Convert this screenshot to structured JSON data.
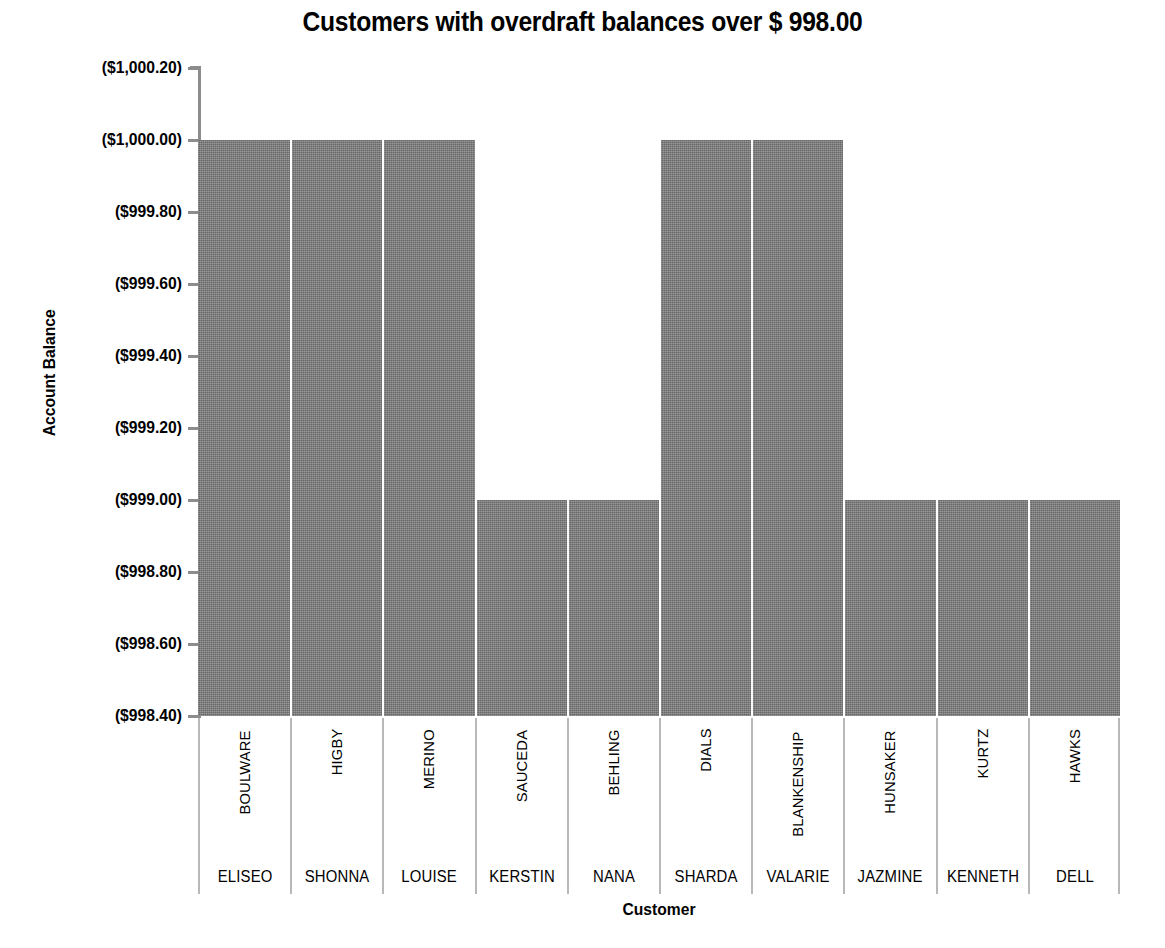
{
  "chart_data": {
    "type": "bar",
    "title": "Customers with overdraft balances over $ 998.00",
    "xlabel": "Customer",
    "ylabel": "Account Balance",
    "grid": false,
    "legend": "none",
    "y_axis_inverted": true,
    "y_tick_labels": [
      "($1,000.20)",
      "($1,000.00)",
      "($999.80)",
      "($999.60)",
      "($999.40)",
      "($999.20)",
      "($999.00)",
      "($998.80)",
      "($998.60)",
      "($998.40)"
    ],
    "y_tick_values": [
      -1000.2,
      -1000.0,
      -999.8,
      -999.6,
      -999.4,
      -999.2,
      -999.0,
      -998.8,
      -998.6,
      -998.4
    ],
    "ylim": [
      -998.4,
      -1000.2
    ],
    "categories": [
      "ELISEO BOULWARE",
      "SHONNA HIGBY",
      "LOUISE MERINO",
      "KERSTIN SAUCEDA",
      "NANA BEHLING",
      "SHARDA DIALS",
      "VALARIE BLANKENSHIP",
      "JAZMINE HUNSAKER",
      "KENNETH KURTZ",
      "DELL HAWKS"
    ],
    "category_last_names": [
      "BOULWARE",
      "HIGBY",
      "MERINO",
      "SAUCEDA",
      "BEHLING",
      "DIALS",
      "BLANKENSHIP",
      "HUNSAKER",
      "KURTZ",
      "HAWKS"
    ],
    "category_first_names": [
      "ELISEO",
      "SHONNA",
      "LOUISE",
      "KERSTIN",
      "NANA",
      "SHARDA",
      "VALARIE",
      "JAZMINE",
      "KENNETH",
      "DELL"
    ],
    "values": [
      -1000.0,
      -1000.0,
      -1000.0,
      -999.0,
      -999.0,
      -1000.0,
      -1000.0,
      -999.0,
      -999.0,
      -999.0
    ],
    "value_labels": [
      "($1,000.00)",
      "($1,000.00)",
      "($1,000.00)",
      "($999.00)",
      "($999.00)",
      "($1,000.00)",
      "($1,000.00)",
      "($999.00)",
      "($999.00)",
      "($999.00)"
    ],
    "bar_color": "#808080",
    "bar_separator_color": "#ffffff",
    "axis_color": "#8c8c8c",
    "text_color": "#000000",
    "background_color": "#ffffff"
  }
}
